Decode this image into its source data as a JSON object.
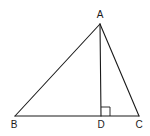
{
  "figure": {
    "type": "triangle-with-altitude",
    "points": {
      "A": {
        "label": "A",
        "x": 100,
        "y": 24,
        "label_x": 100,
        "label_y": 18
      },
      "B": {
        "label": "B",
        "x": 15,
        "y": 116,
        "label_x": 14,
        "label_y": 128
      },
      "C": {
        "label": "C",
        "x": 139,
        "y": 116,
        "label_x": 139,
        "label_y": 128
      },
      "D": {
        "label": "D",
        "x": 101,
        "y": 116,
        "label_x": 101,
        "label_y": 128
      }
    },
    "segments": [
      {
        "from": "A",
        "to": "B",
        "name": "side-ab"
      },
      {
        "from": "A",
        "to": "C",
        "name": "side-ac"
      },
      {
        "from": "B",
        "to": "C",
        "name": "side-bc"
      },
      {
        "from": "A",
        "to": "D",
        "name": "altitude-ad"
      }
    ],
    "right_angle": {
      "at": "D",
      "size": 9
    },
    "colors": {
      "stroke": "#1a1a1a",
      "background": "#ffffff"
    }
  }
}
